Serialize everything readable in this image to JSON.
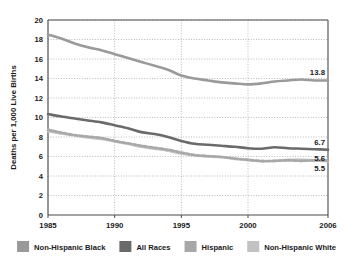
{
  "chart_data": {
    "type": "line",
    "title": "",
    "xlabel": "",
    "ylabel": "Deaths per 1,000 Live Births",
    "xlim": [
      1985,
      2006
    ],
    "ylim": [
      0,
      20
    ],
    "ytick_values": [
      0,
      2,
      4,
      6,
      8,
      10,
      12,
      14,
      16,
      18,
      20
    ],
    "ytick_labels": [
      "0",
      "2",
      "4",
      "6",
      "8",
      "10",
      "12",
      "14",
      "16",
      "18",
      "20"
    ],
    "xtick_values": [
      1985,
      1990,
      1995,
      2000,
      2006
    ],
    "xtick_labels": [
      "1985",
      "1990",
      "1995",
      "2000",
      "2006"
    ],
    "grid": "dotted-both",
    "legend_position": "bottom",
    "x": [
      1985,
      1986,
      1987,
      1988,
      1989,
      1990,
      1991,
      1992,
      1993,
      1994,
      1995,
      1996,
      1997,
      1998,
      1999,
      2000,
      2001,
      2002,
      2003,
      2004,
      2005,
      2006
    ],
    "series": [
      {
        "name": "Non-Hispanic Black",
        "color": "#9a9a9a",
        "style": "solid",
        "end_label": "13.8",
        "values": [
          18.5,
          18.1,
          17.6,
          17.2,
          16.9,
          16.5,
          16.1,
          15.7,
          15.3,
          14.9,
          14.3,
          14.0,
          13.8,
          13.6,
          13.5,
          13.4,
          13.5,
          13.7,
          13.8,
          13.9,
          13.8,
          13.8
        ]
      },
      {
        "name": "All Races",
        "color": "#6a6a6a",
        "style": "solid",
        "end_label": "6.7",
        "values": [
          10.35,
          10.1,
          9.9,
          9.7,
          9.5,
          9.2,
          8.9,
          8.5,
          8.3,
          8.0,
          7.6,
          7.3,
          7.2,
          7.1,
          7.0,
          6.85,
          6.8,
          6.95,
          6.85,
          6.8,
          6.75,
          6.7
        ]
      },
      {
        "name": "Hispanic",
        "color": "#a8a8a8",
        "style": "dashed",
        "end_label": "5.6",
        "values": [
          8.75,
          8.45,
          8.2,
          8.05,
          7.9,
          7.6,
          7.35,
          7.1,
          6.9,
          6.7,
          6.4,
          6.15,
          6.05,
          5.95,
          5.8,
          5.65,
          5.55,
          5.55,
          5.6,
          5.55,
          5.6,
          5.6
        ]
      },
      {
        "name": "Non-Hispanic White",
        "color": "#c2c2c2",
        "style": "solid",
        "end_label": "5.5",
        "values": [
          8.6,
          8.35,
          8.15,
          7.95,
          7.8,
          7.55,
          7.3,
          7.0,
          6.8,
          6.6,
          6.3,
          6.1,
          6.0,
          5.95,
          5.75,
          5.65,
          5.5,
          5.55,
          5.65,
          5.65,
          5.6,
          5.5
        ]
      }
    ],
    "legend": [
      {
        "label": "Non-Hispanic Black",
        "color": "#9a9a9a"
      },
      {
        "label": "All Races",
        "color": "#6a6a6a"
      },
      {
        "label": "Hispanic",
        "color": "#a8a8a8"
      },
      {
        "label": "Non-Hispanic White",
        "color": "#c2c2c2"
      }
    ],
    "colors": {
      "axis": "#4a4a4a",
      "grid": "#9d9d9d",
      "text": "#1a1a1a",
      "background": "#ffffff"
    }
  }
}
